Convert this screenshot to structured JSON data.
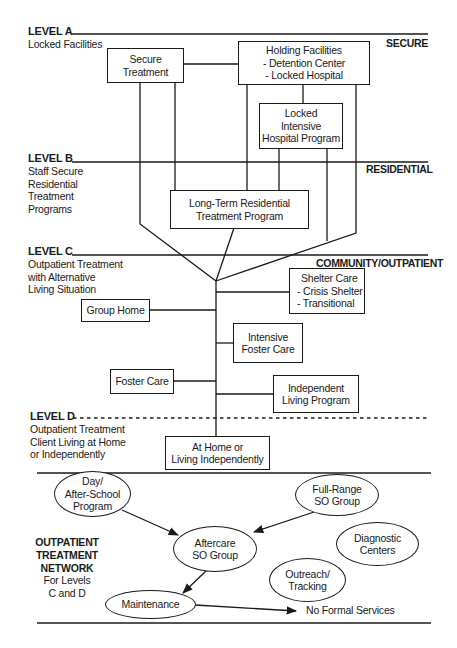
{
  "levels": {
    "a": {
      "heading": "LEVEL A",
      "desc": [
        "Locked Facilities"
      ]
    },
    "b": {
      "heading": "LEVEL B",
      "desc": [
        "Staff Secure",
        "Residential",
        "Treatment",
        "Programs"
      ]
    },
    "c": {
      "heading": "LEVEL C",
      "desc": [
        "Outpatient Treatment",
        "with Alternative",
        "Living Situation"
      ]
    },
    "d": {
      "heading": "LEVEL D",
      "desc": [
        "Outpatient Treatment",
        "Client Living at Home",
        "or Independently"
      ]
    }
  },
  "zones": {
    "secure": "SECURE",
    "residential": "RESIDENTIAL",
    "community": "COMMUNITY/OUTPATIENT"
  },
  "boxes": {
    "secure_treatment": [
      "Secure",
      "Treatment"
    ],
    "holding_facilities": [
      "Holding Facilities",
      "- Detention Center",
      "- Locked Hospital"
    ],
    "locked_intensive": [
      "Locked",
      "Intensive",
      "Hospital Program"
    ],
    "long_term": [
      "Long-Term Residential",
      "Treatment Program"
    ],
    "shelter_care": [
      "Shelter Care",
      "- Crisis Shelter",
      "- Transitional"
    ],
    "group_home": [
      "Group Home"
    ],
    "intensive_foster": [
      "Intensive",
      "Foster Care"
    ],
    "foster_care": [
      "Foster Care"
    ],
    "independent_living": [
      "Independent",
      "Living Program"
    ],
    "at_home": [
      "At Home or",
      "Living Independently"
    ]
  },
  "network": {
    "title": [
      "OUTPATIENT",
      "TREATMENT",
      "NETWORK"
    ],
    "subtitle": [
      "For Levels",
      "C and D"
    ],
    "nodes": {
      "day_school": [
        "Day/",
        "After-School",
        "Program"
      ],
      "full_range": [
        "Full-Range",
        "SO Group"
      ],
      "aftercare": [
        "Aftercare",
        "SO Group"
      ],
      "diagnostic": [
        "Diagnostic",
        "Centers"
      ],
      "outreach": [
        "Outreach/",
        "Tracking"
      ],
      "maintenance": [
        "Maintenance"
      ]
    },
    "terminal": "No Formal Services"
  }
}
